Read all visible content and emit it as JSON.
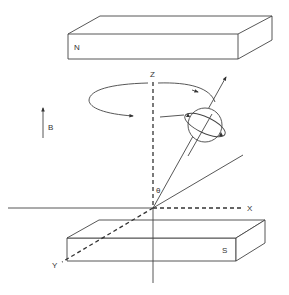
{
  "diagram": {
    "type": "nmr-precession",
    "labels": {
      "north_pole": "N",
      "south_pole": "S",
      "field": "B",
      "z_axis": "Z",
      "x_axis": "X",
      "y_axis": "Y",
      "angle": "θ"
    },
    "colors": {
      "line": "#444444",
      "background": "#ffffff"
    }
  }
}
